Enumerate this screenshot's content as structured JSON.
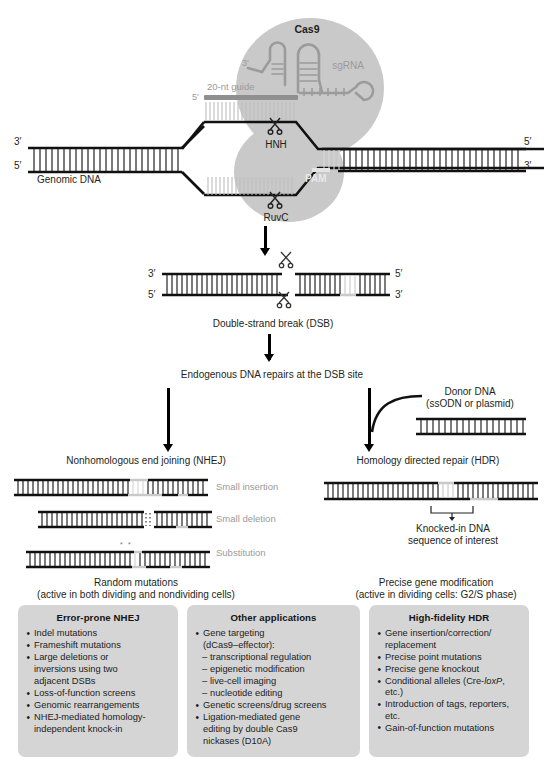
{
  "top_complex": {
    "cas9_label": "Cas9",
    "sgrna_label": "sgRNA",
    "guide_label": "20-nt guide",
    "guide_five_prime": "5′",
    "sgrna_three_prime": "3′",
    "hnh_label": "HNH",
    "ruvc_label": "RuvC",
    "pam_label": "PAM",
    "genomic_dna_label": "Genomic DNA",
    "left_top_prime": "3′",
    "left_bottom_prime": "5′",
    "right_top_prime": "5′",
    "right_bottom_prime": "3′"
  },
  "dsb": {
    "caption": "Double-strand break (DSB)",
    "left_top_prime": "3′",
    "left_bottom_prime": "5′",
    "right_top_prime": "5′",
    "right_bottom_prime": "3′"
  },
  "repair_intro": {
    "caption": "Endogenous DNA repairs at the DSB site"
  },
  "donor": {
    "line1": "Donor DNA",
    "line2": "(ssODN or plasmid)"
  },
  "nhej": {
    "title": "Nonhomologous end joining (NHEJ)",
    "outcomes": [
      "Small insertion",
      "Small deletion",
      "Substitution"
    ],
    "footer_line1": "Random mutations",
    "footer_line2": "(active in both dividing and nondividing cells)"
  },
  "hdr": {
    "title": "Homology directed repair (HDR)",
    "knockin_line1": "Knocked-in DNA",
    "knockin_line2": "sequence of interest",
    "footer_line1": "Precise gene modification",
    "footer_line2": "(active in dividing cells: G2/S phase)"
  },
  "boxes": [
    {
      "id": "error-prone-nhej",
      "heading": "Error-prone NHEJ",
      "items": [
        {
          "type": "bullet",
          "text": "Indel mutations"
        },
        {
          "type": "bullet",
          "text": "Frameshift mutations"
        },
        {
          "type": "bullet",
          "text": "Large deletions or"
        },
        {
          "type": "cont",
          "text": "inversions using two"
        },
        {
          "type": "cont",
          "text": "adjacent DSBs"
        },
        {
          "type": "bullet",
          "text": "Loss-of-function screens"
        },
        {
          "type": "bullet",
          "text": "Genomic rearrangements"
        },
        {
          "type": "bullet",
          "text": "NHEJ-mediated homology-"
        },
        {
          "type": "cont",
          "text": "independent knock-in"
        }
      ]
    },
    {
      "id": "other-applications",
      "heading": "Other applications",
      "items": [
        {
          "type": "bullet",
          "text": "Gene targeting"
        },
        {
          "type": "cont",
          "text": "(dCas9–effector):"
        },
        {
          "type": "sub",
          "text": "transcriptional regulation"
        },
        {
          "type": "sub",
          "text": "epigenetic modification"
        },
        {
          "type": "sub",
          "text": "live-cell imaging"
        },
        {
          "type": "sub",
          "text": "nucleotide editing"
        },
        {
          "type": "bullet",
          "text": "Genetic screens/drug screens"
        },
        {
          "type": "bullet",
          "text": "Ligation-mediated gene"
        },
        {
          "type": "cont",
          "text": "editing by double Cas9"
        },
        {
          "type": "cont",
          "text": "nickases (D10A)"
        }
      ]
    },
    {
      "id": "high-fidelity-hdr",
      "heading": "High-fidelity HDR",
      "items": [
        {
          "type": "bullet",
          "text": "Gene insertion/correction/"
        },
        {
          "type": "cont",
          "text": "replacement"
        },
        {
          "type": "bullet",
          "text": "Precise point mutations"
        },
        {
          "type": "bullet",
          "text": "Precise gene knockout"
        },
        {
          "type": "bullet",
          "text": "Conditional alleles (Cre-loxP, etc.)",
          "italic_part": "loxP"
        },
        {
          "type": "bullet",
          "text": "Introduction of tags, reporters, etc."
        },
        {
          "type": "bullet",
          "text": "Gain-of-function mutations"
        }
      ]
    }
  ],
  "colors": {
    "box_background": "#d5d5d5",
    "cas9_blob": "#c9c9c9",
    "guide_bar": "#8f8f8f",
    "gray_text": "#9a9a9a",
    "strand_black": "#111111",
    "strand_gray": "#b9b9b9"
  }
}
